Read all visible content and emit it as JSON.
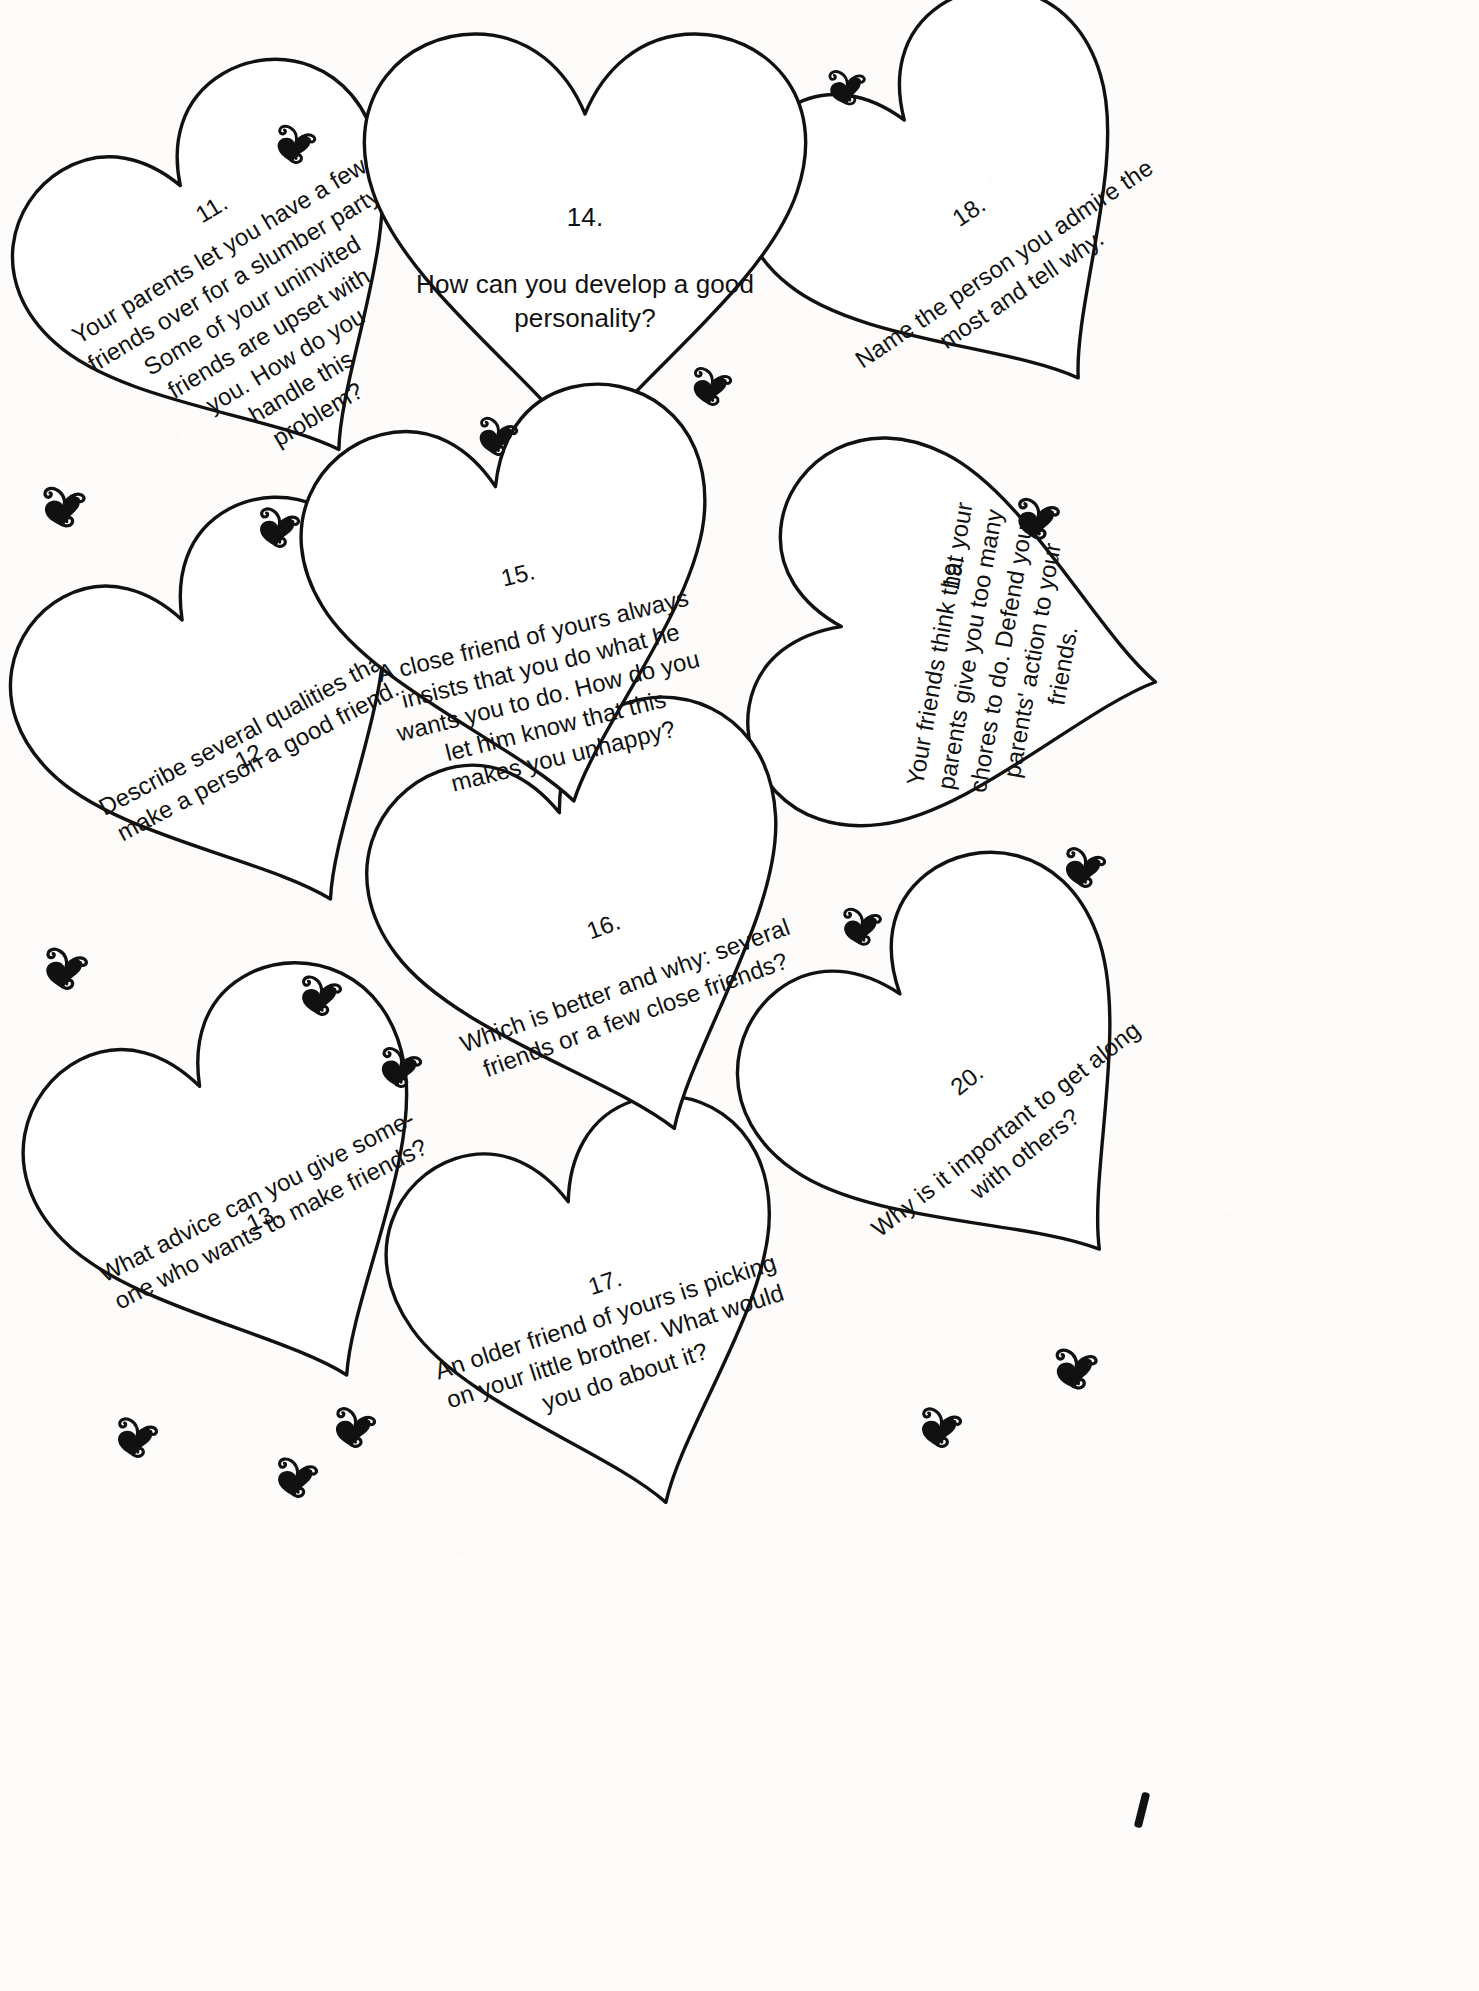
{
  "page": {
    "background_color": "#fdfcfa",
    "ink_color": "#111111",
    "ornament_icon": "heart-with-curl-icon",
    "ornament_count": 17
  },
  "cards": [
    {
      "id": "card-11",
      "number": "11.",
      "text": "Your parents let you have a few friends over for a slumber party. Some of your uninvited friends are upset with you. How do you handle this problem?",
      "lines": "Your parents let you have a few\nfriends over for a slumber party.\nSome of your uninvited\nfriends are upset with\nyou. How do you\nhandle this\nproblem?",
      "rotation_deg": -31,
      "number_position": "inline-first-line"
    },
    {
      "id": "card-12",
      "number": "12.",
      "text": "Describe several qualities that make a person a good friend.",
      "lines": "Describe  several  qualities  that\nmake a person a good friend.",
      "rotation_deg": -28,
      "number_position": "inline-first-line"
    },
    {
      "id": "card-13",
      "number": "13.",
      "text": "What advice can you give someone who wants to make friends?",
      "lines": "What advice can you give some-\none who wants to make friends?",
      "rotation_deg": -27,
      "number_position": "inline-first-line"
    },
    {
      "id": "card-14",
      "number": "14.",
      "text": "How can you develop a good personality?",
      "lines": "How  can  you  develop  a  good\npersonality?",
      "rotation_deg": 0,
      "number_position": "above"
    },
    {
      "id": "card-15",
      "number": "15.",
      "text": "A close friend of yours always insists that you do what he wants you to do. How do you let him know that this makes you unhappy?",
      "lines": "A close friend of yours always\ninsists that you do what he\nwants you to do. How do you\nlet him know that this\nmakes you unhappy?",
      "rotation_deg": -14,
      "number_position": "above"
    },
    {
      "id": "card-16",
      "number": "16.",
      "text": "Which is better and why: several friends or a few close friends?",
      "lines": "Which is better and why: several\nfriends or a few close friends?",
      "rotation_deg": -20,
      "number_position": "above"
    },
    {
      "id": "card-17",
      "number": "17.",
      "text": "An older friend of yours is picking on your little brother. What would you do about it?",
      "lines": "An older friend of yours is picking\non your little brother. What would\nyou do about it?",
      "rotation_deg": -18,
      "number_position": "inline-first-line"
    },
    {
      "id": "card-18",
      "number": "18.",
      "text": "Name the person you admire the most and tell why.",
      "lines": "Name the person you admire the\nmost and tell why.",
      "rotation_deg": -34,
      "number_position": "above"
    },
    {
      "id": "card-19",
      "number": "19.",
      "text": "Your friends think that your parents give you too many chores to do. Defend your parents' action to your friends.",
      "lines": "Your friends think that your\nparents give you too many\nchores to do. Defend your\nparents' action to your\nfriends.",
      "rotation_deg": -80,
      "number_position": "inline-first-line"
    },
    {
      "id": "card-20",
      "number": "20.",
      "text": "Why is it important to get along with others?",
      "lines": "Why is it important to get along\nwith others?",
      "rotation_deg": -38,
      "number_position": "above"
    }
  ],
  "ornaments": [
    {
      "name": "ornament-1",
      "x": 272,
      "y": 118,
      "size": 46,
      "rot": 4
    },
    {
      "name": "ornament-2",
      "x": 824,
      "y": 62,
      "size": 44,
      "rot": -6
    },
    {
      "name": "ornament-3",
      "x": 688,
      "y": 360,
      "size": 46,
      "rot": 2
    },
    {
      "name": "ornament-4",
      "x": 474,
      "y": 410,
      "size": 46,
      "rot": 3
    },
    {
      "name": "ornament-5",
      "x": 38,
      "y": 478,
      "size": 50,
      "rot": -4
    },
    {
      "name": "ornament-6",
      "x": 254,
      "y": 500,
      "size": 48,
      "rot": 2
    },
    {
      "name": "ornament-7",
      "x": 1012,
      "y": 490,
      "size": 50,
      "rot": 1
    },
    {
      "name": "ornament-8",
      "x": 1060,
      "y": 840,
      "size": 48,
      "rot": 3
    },
    {
      "name": "ornament-9",
      "x": 838,
      "y": 900,
      "size": 46,
      "rot": -2
    },
    {
      "name": "ornament-10",
      "x": 40,
      "y": 940,
      "size": 50,
      "rot": 2
    },
    {
      "name": "ornament-11",
      "x": 296,
      "y": 968,
      "size": 48,
      "rot": 1
    },
    {
      "name": "ornament-12",
      "x": 376,
      "y": 1040,
      "size": 48,
      "rot": 4
    },
    {
      "name": "ornament-13",
      "x": 1050,
      "y": 1340,
      "size": 50,
      "rot": -3
    },
    {
      "name": "ornament-14",
      "x": 112,
      "y": 1410,
      "size": 48,
      "rot": 2
    },
    {
      "name": "ornament-15",
      "x": 272,
      "y": 1450,
      "size": 48,
      "rot": 1
    },
    {
      "name": "ornament-16",
      "x": 330,
      "y": 1400,
      "size": 48,
      "rot": 3
    },
    {
      "name": "ornament-17",
      "x": 916,
      "y": 1400,
      "size": 48,
      "rot": 2
    }
  ]
}
